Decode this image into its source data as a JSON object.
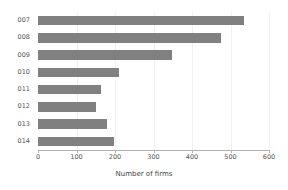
{
  "chart_data": {
    "type": "bar",
    "orientation": "horizontal",
    "title": "",
    "xlabel": "Number of firms",
    "ylabel": "",
    "categories": [
      "007",
      "008",
      "009",
      "010",
      "011",
      "012",
      "013",
      "014"
    ],
    "values": [
      535,
      475,
      348,
      210,
      164,
      150,
      179,
      197
    ],
    "xlim": [
      0,
      600
    ],
    "xticks": [
      0,
      100,
      200,
      300,
      400,
      500,
      600
    ],
    "xtick_labels": [
      "0",
      "100",
      "200",
      "300",
      "400",
      "500",
      "600"
    ],
    "grid": true,
    "grid_axis": "x",
    "legend": false,
    "series": [
      {
        "name": "Number of firms",
        "values": [
          535,
          475,
          348,
          210,
          164,
          150,
          179,
          197
        ]
      }
    ]
  },
  "style": {
    "bar_color": "#808080",
    "background_color": "#ffffff",
    "grid_color": "#f0f0f0",
    "axis_color": "#b0b0b0",
    "text_color": "#555555"
  }
}
